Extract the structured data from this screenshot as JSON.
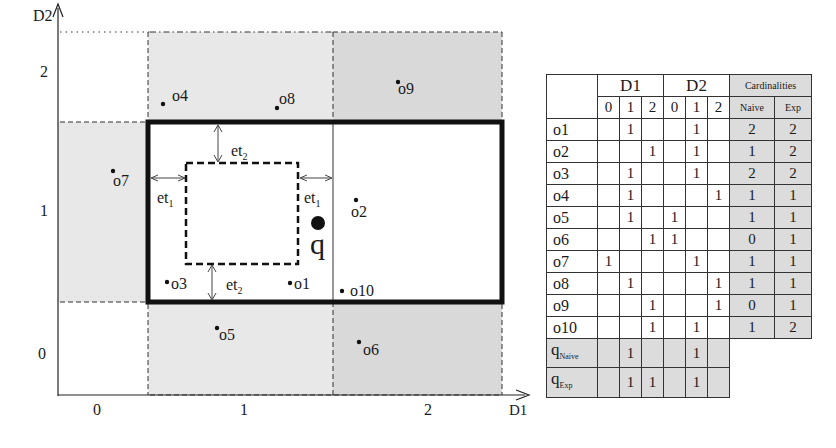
{
  "plot": {
    "axes": {
      "x_label": "D1",
      "y_label": "D2",
      "x_ticks": [
        "0",
        "1",
        "2"
      ],
      "y_ticks": [
        "0",
        "1",
        "2"
      ]
    },
    "query": {
      "label": "q"
    },
    "threshold_labels": {
      "et1": "et",
      "et1_sub": "1",
      "et2": "et",
      "et2_sub": "2"
    },
    "points": [
      {
        "id": "o1",
        "label": "o1",
        "x": 290,
        "y": 283
      },
      {
        "id": "o2",
        "label": "o2",
        "x": 356,
        "y": 200
      },
      {
        "id": "o3",
        "label": "o3",
        "x": 167,
        "y": 282
      },
      {
        "id": "o4",
        "label": "o4",
        "x": 163,
        "y": 104
      },
      {
        "id": "o5",
        "label": "o5",
        "x": 217,
        "y": 328
      },
      {
        "id": "o6",
        "label": "o6",
        "x": 359,
        "y": 342
      },
      {
        "id": "o7",
        "label": "o7",
        "x": 113,
        "y": 171
      },
      {
        "id": "o8",
        "label": "o8",
        "x": 277,
        "y": 108
      },
      {
        "id": "o9",
        "label": "o9",
        "x": 398,
        "y": 82
      },
      {
        "id": "o10",
        "label": "o10",
        "x": 342,
        "y": 291
      }
    ]
  },
  "table": {
    "header": {
      "d1": "D1",
      "d2": "D2",
      "cardinalities": "Cardinalities",
      "sub_cols": [
        "0",
        "1",
        "2",
        "0",
        "1",
        "2"
      ],
      "naive": "Naive",
      "exp": "Exp"
    },
    "rows": [
      {
        "label": "o1",
        "cells": [
          "",
          "1",
          "",
          "",
          "1",
          ""
        ],
        "naive": "2",
        "exp": "2"
      },
      {
        "label": "o2",
        "cells": [
          "",
          "",
          "1",
          "",
          "1",
          ""
        ],
        "naive": "1",
        "exp": "2"
      },
      {
        "label": "o3",
        "cells": [
          "",
          "1",
          "",
          "",
          "1",
          ""
        ],
        "naive": "2",
        "exp": "2"
      },
      {
        "label": "o4",
        "cells": [
          "",
          "1",
          "",
          "",
          "",
          "1"
        ],
        "naive": "1",
        "exp": "1"
      },
      {
        "label": "o5",
        "cells": [
          "",
          "1",
          "",
          "1",
          "",
          ""
        ],
        "naive": "1",
        "exp": "1"
      },
      {
        "label": "o6",
        "cells": [
          "",
          "",
          "1",
          "1",
          "",
          ""
        ],
        "naive": "0",
        "exp": "1"
      },
      {
        "label": "o7",
        "cells": [
          "1",
          "",
          "",
          "",
          "1",
          ""
        ],
        "naive": "1",
        "exp": "1"
      },
      {
        "label": "o8",
        "cells": [
          "",
          "1",
          "",
          "",
          "",
          "1"
        ],
        "naive": "1",
        "exp": "1"
      },
      {
        "label": "o9",
        "cells": [
          "",
          "",
          "1",
          "",
          "",
          "1"
        ],
        "naive": "0",
        "exp": "1"
      },
      {
        "label": "o10",
        "cells": [
          "",
          "",
          "1",
          "",
          "1",
          ""
        ],
        "naive": "1",
        "exp": "2"
      }
    ],
    "query_rows": [
      {
        "label": "q",
        "sub": "Naive",
        "cells": [
          "",
          "1",
          "",
          "",
          "1",
          ""
        ]
      },
      {
        "label": "q",
        "sub": "Exp",
        "cells": [
          "",
          "1",
          "1",
          "",
          "1",
          ""
        ]
      }
    ]
  },
  "colors": {
    "shade_light": "#e6e6e6",
    "shade_dark": "#d6d6d6",
    "line": "#1a1a1a",
    "table_shade": "#dcdcdc"
  }
}
